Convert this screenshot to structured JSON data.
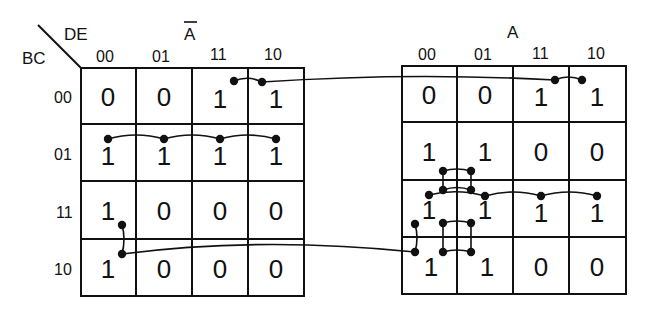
{
  "diagram": {
    "type": "karnaugh-map-5-variable",
    "row_variable_label": "BC",
    "column_variable_label": "DE",
    "row_labels": [
      "00",
      "01",
      "11",
      "10"
    ],
    "column_labels": [
      "00",
      "01",
      "11",
      "10"
    ],
    "maps": [
      {
        "id": "not-a",
        "title": "Ā",
        "cells": [
          [
            "0",
            "0",
            "1",
            "1"
          ],
          [
            "1",
            "1",
            "1",
            "1"
          ],
          [
            "1",
            "0",
            "0",
            "0"
          ],
          [
            "1",
            "0",
            "0",
            "0"
          ]
        ]
      },
      {
        "id": "a",
        "title": "A",
        "cells": [
          [
            "0",
            "0",
            "1",
            "1"
          ],
          [
            "1",
            "1",
            "0",
            "0"
          ],
          [
            "1",
            "1",
            "1",
            "1"
          ],
          [
            "1",
            "1",
            "0",
            "0"
          ]
        ]
      }
    ],
    "colors": {
      "ink": "#111111",
      "background": "#ffffff"
    }
  }
}
